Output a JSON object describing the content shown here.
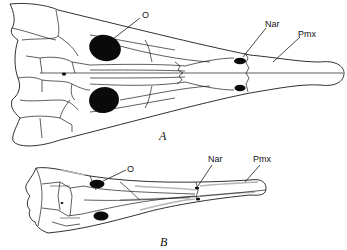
{
  "figure": {
    "panels": [
      {
        "id": "A",
        "panel_label": "A",
        "description": "Dorsal view of skull (broad)",
        "labels": {
          "orbit": "O",
          "naris": "Nar",
          "premaxilla": "Pmx"
        }
      },
      {
        "id": "B",
        "panel_label": "B",
        "description": "Dorsal view of skull (narrow, elongate snout)",
        "labels": {
          "orbit": "O",
          "naris": "Nar",
          "premaxilla": "Pmx"
        }
      }
    ],
    "colors": {
      "line": "#1a1a1a",
      "fill_openings": "#0a0a0a",
      "background": "#ffffff",
      "shading": "#b5b5b5"
    }
  }
}
